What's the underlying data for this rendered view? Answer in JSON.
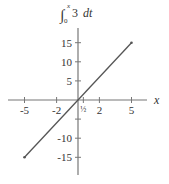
{
  "chart_data": {
    "type": "line",
    "title_parts": {
      "integral": "∫",
      "upper": "x",
      "lower": "0",
      "integrand": "3",
      "differential": "dt"
    },
    "xlabel": "x",
    "ylabel": "",
    "xlim": [
      -6.5,
      7.5
    ],
    "ylim": [
      -19,
      19
    ],
    "x_ticks": [
      -5,
      -2,
      0.5,
      2,
      5
    ],
    "x_tick_labels": [
      "-5",
      "-2",
      "½",
      "2",
      "5"
    ],
    "y_ticks": [
      -15,
      -10,
      -5,
      5,
      10,
      15
    ],
    "y_tick_labels": [
      "-15",
      "-10",
      "",
      "5",
      "10",
      "15"
    ],
    "grid": false,
    "legend": null,
    "series": [
      {
        "name": "3x",
        "x": [
          -5,
          5
        ],
        "y": [
          -15,
          15
        ],
        "color": "#555555",
        "endpoints_marked": true
      }
    ]
  },
  "colors": {
    "axis": "#777777",
    "line": "#555555",
    "text": "#333333"
  }
}
